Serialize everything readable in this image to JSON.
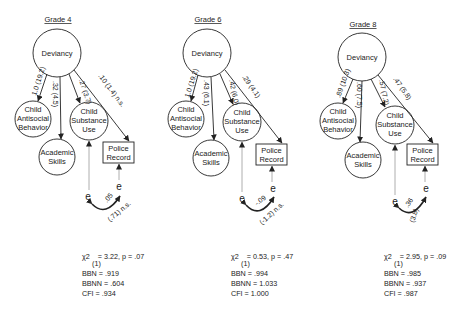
{
  "panels": [
    {
      "title": "Grade 4",
      "nodes": {
        "deviancy": "Deviancy",
        "antisocial": [
          "Child",
          "Antisocial",
          "Behavior"
        ],
        "academic": [
          "Academic",
          "Skills"
        ],
        "substance": [
          "Child",
          "Substance",
          "Use"
        ],
        "police": [
          "Police",
          "Record"
        ]
      },
      "paths": {
        "dev_antisocial": "1.0 (19.2)",
        "dev_academic": ".32 (4.5)",
        "dev_substance": ".27 (3.7)",
        "dev_police": ".10 (1.4) n.s."
      },
      "error_symbol": "e",
      "error_cov": ".05",
      "error_cov_t": "(.71) n.s.",
      "stats": {
        "chi_label": "χ2",
        "chi_df": "(1)",
        "chi_value": "= 3.22, p = .07",
        "bbn": "BBN = .919",
        "bbnn": "BBNN = .604",
        "cfi": "CFI = .934"
      }
    },
    {
      "title": "Grade 6",
      "nodes": {
        "deviancy": "Deviancy",
        "antisocial": [
          "Child",
          "Antisocial",
          "Behavior"
        ],
        "academic": [
          "Academic",
          "Skills"
        ],
        "substance": [
          "Child",
          "Substance",
          "Use"
        ],
        "police": [
          "Police",
          "Record"
        ]
      },
      "paths": {
        "dev_antisocial": "1.0 (19.2)",
        "dev_academic": ".43 (6.1)",
        "dev_substance": ".42 (6.0)",
        "dev_police": ".29 (4.1)"
      },
      "error_symbol": "e",
      "error_cov": "-.09",
      "error_cov_t": "(-1.2) n.s.",
      "stats": {
        "chi_label": "χ2",
        "chi_df": "(1)",
        "chi_value": "= 0.53, p = .47",
        "bbn": "BBN = .994",
        "bbnn": "BBNN = 1.033",
        "cfi": "CFI = 1.000"
      }
    },
    {
      "title": "Grade 8",
      "nodes": {
        "deviancy": "Deviancy",
        "antisocial": [
          "Child",
          "Antisocial",
          "Behavior"
        ],
        "academic": [
          "Academic",
          "Skills"
        ],
        "substance": [
          "Child",
          "Substance",
          "Use"
        ],
        "police": [
          "Police",
          "Record"
        ]
      },
      "paths": {
        "dev_antisocial": ".89 (10.3)",
        "dev_academic": ".60 (7.5)",
        "dev_substance": ".57 (7.2)",
        "dev_police": ".47 (5.8)"
      },
      "error_symbol": "e",
      "error_cov": ".36",
      "error_cov_t": "(3.8)",
      "stats": {
        "chi_label": "χ2",
        "chi_df": "(1)",
        "chi_value": "= 2.95, p = .09",
        "bbn": "BBN = .985",
        "bbnn": "BBNN = .937",
        "cfi": "CFI = .987"
      }
    }
  ]
}
